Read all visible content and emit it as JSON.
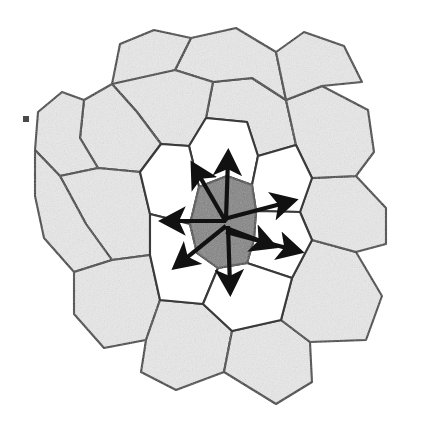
{
  "figure": {
    "canvas": {
      "width": 434,
      "height": 422,
      "background": "#ffffff"
    }
  },
  "palette": {
    "outer_cell_fill": "#e9e9e9",
    "ring_cell_fill": "#ffffff",
    "center_cell_fill": "#838383",
    "cell_border": "#3a3a3a",
    "arrow_color": "#111111",
    "background": "#ffffff"
  },
  "chart_data": {
    "type": "diagram",
    "center_cell": {
      "label": "central-cell",
      "fill": "#838383",
      "centroid": [
        222,
        221
      ],
      "points": "199,187 227,176 252,185 256,211 254,239 247,263 218,268 197,253 190,224"
    },
    "arrow_count": 8,
    "arrows": [
      {
        "name": "arrow-north",
        "direction": "N",
        "from": [
          226,
          219
        ],
        "to": [
          228,
          159
        ]
      },
      {
        "name": "arrow-northwest",
        "direction": "NW",
        "from": [
          226,
          222
        ],
        "to": [
          196,
          170
        ]
      },
      {
        "name": "arrow-east",
        "direction": "E",
        "from": [
          224,
          219
        ],
        "to": [
          288,
          202
        ]
      },
      {
        "name": "arrow-west",
        "direction": "W",
        "from": [
          226,
          221
        ],
        "to": [
          169,
          221
        ]
      },
      {
        "name": "arrow-east-lower",
        "direction": "ESE",
        "from": [
          226,
          232
        ],
        "to": [
          294,
          250
        ]
      },
      {
        "name": "arrow-southwest",
        "direction": "SW",
        "from": [
          226,
          226
        ],
        "to": [
          180,
          263
        ]
      },
      {
        "name": "arrow-south",
        "direction": "S",
        "from": [
          228,
          226
        ],
        "to": [
          230,
          286
        ]
      },
      {
        "name": "arrow-southeast",
        "direction": "SE",
        "from": [
          226,
          228
        ],
        "to": [
          268,
          244
        ]
      }
    ],
    "ring_cells": [
      {
        "name": "ring-cell-n",
        "fill": "#ffffff",
        "points": "199,187 227,176 252,185 258,156 247,122 206,118 189,146"
      },
      {
        "name": "ring-cell-ne",
        "fill": "#ffffff",
        "points": "252,185 256,211 300,212 312,178 296,145 258,156"
      },
      {
        "name": "ring-cell-nw",
        "fill": "#ffffff",
        "points": "189,146 199,187 190,224 150,214 140,172 161,144"
      },
      {
        "name": "ring-cell-e",
        "fill": "#ffffff",
        "points": "256,211 254,239 247,263 292,278 312,240 300,212"
      },
      {
        "name": "ring-cell-w",
        "fill": "#ffffff",
        "points": "190,224 197,253 218,268 203,304 160,300 150,255 150,214"
      },
      {
        "name": "ring-cell-s",
        "fill": "#ffffff",
        "points": "218,268 247,263 292,278 281,320 232,331 203,304"
      }
    ],
    "outer_cells": [
      {
        "name": "outer-cell-01",
        "fill": "#e9e9e9",
        "points": "206,118 247,122 258,156 296,145 286,100 252,78 213,82"
      },
      {
        "name": "outer-cell-02",
        "fill": "#e9e9e9",
        "points": "213,82 252,78 286,100 276,52 236,28 191,38 175,70"
      },
      {
        "name": "outer-cell-03",
        "fill": "#e9e9e9",
        "points": "175,70 191,38 154,30 120,44 112,84 137,112"
      },
      {
        "name": "outer-cell-04",
        "fill": "#e9e9e9",
        "points": "175,70 213,82 206,118 189,146 161,144 137,112 112,84"
      },
      {
        "name": "outer-cell-05",
        "fill": "#e9e9e9",
        "points": "112,84 137,112 161,144 140,172 98,168 80,138 84,100"
      },
      {
        "name": "outer-cell-06",
        "fill": "#e9e9e9",
        "points": "84,100 80,138 98,168 60,176 35,150 38,112 62,92"
      },
      {
        "name": "outer-cell-07",
        "fill": "#e9e9e9",
        "points": "98,168 140,172 150,214 150,255 112,260 86,224 60,176"
      },
      {
        "name": "outer-cell-08",
        "fill": "#e9e9e9",
        "points": "60,176 86,224 112,260 74,272 44,238 35,196 35,150"
      },
      {
        "name": "outer-cell-09",
        "fill": "#e9e9e9",
        "points": "112,260 150,255 160,300 146,340 104,348 74,314 74,272"
      },
      {
        "name": "outer-cell-10",
        "fill": "#e9e9e9",
        "points": "146,340 160,300 203,304 232,331 224,372 176,390 141,372"
      },
      {
        "name": "outer-cell-11",
        "fill": "#e9e9e9",
        "points": "232,331 281,320 310,342 312,382 276,404 224,372"
      },
      {
        "name": "outer-cell-12",
        "fill": "#e9e9e9",
        "points": "281,320 292,278 312,240 356,252 382,296 366,340 310,342"
      },
      {
        "name": "outer-cell-13",
        "fill": "#e9e9e9",
        "points": "312,240 300,212 312,178 356,176 386,208 386,244 356,252"
      },
      {
        "name": "outer-cell-14",
        "fill": "#e9e9e9",
        "points": "312,178 296,145 286,100 322,86 368,110 374,152 356,176"
      },
      {
        "name": "outer-cell-15",
        "fill": "#e9e9e9",
        "points": "286,100 276,52 304,32 344,46 362,82 322,86"
      }
    ],
    "artifacts": [
      {
        "name": "speck-mark",
        "position": [
          26,
          119
        ],
        "width": 6,
        "height": 6
      }
    ]
  }
}
